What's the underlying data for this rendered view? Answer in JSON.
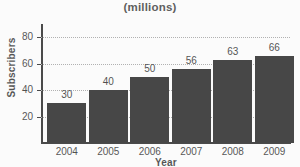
{
  "chart_data": {
    "type": "bar",
    "title": "(millions)",
    "xlabel": "Year",
    "ylabel": "Subscribers",
    "categories": [
      "2004",
      "2005",
      "2006",
      "2007",
      "2008",
      "2009"
    ],
    "values": [
      30,
      40,
      50,
      56,
      63,
      66
    ],
    "value_labels": [
      "30",
      "40",
      "50",
      "56",
      "63",
      "66"
    ],
    "ylim": [
      0,
      90
    ],
    "y_ticks": [
      20,
      40,
      60,
      80
    ],
    "y_tick_labels": [
      "20",
      "40",
      "60",
      "80"
    ],
    "grid": true,
    "grid_style": "dotted-horizontal",
    "legend": null,
    "bar_color": "#0c0c0c",
    "background_color": "#fdfdfd",
    "axis_color": "#111111",
    "grid_color": "#9a9a9a"
  }
}
